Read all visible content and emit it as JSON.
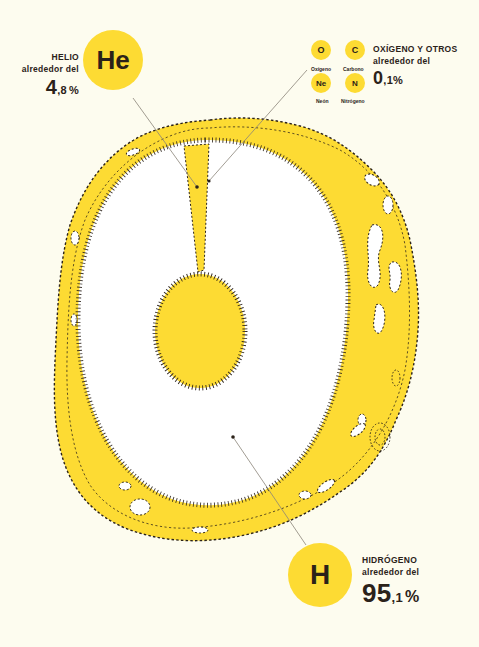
{
  "colors": {
    "background": "#fdfcef",
    "yellow": "#fddb33",
    "white": "#ffffff",
    "ink": "#2b2219",
    "leader_line": "#8a8478"
  },
  "helium": {
    "symbol": "He",
    "name": "HELIO",
    "prefix": "alrededor del",
    "value_int": "4",
    "value_dec": ",8",
    "unit": "%"
  },
  "others": {
    "name": "OXÍGENO Y OTROS",
    "prefix": "alrededor del",
    "value_int": "0",
    "value_dec": ",1",
    "unit": "%",
    "elements": [
      {
        "symbol": "O",
        "name": "Oxígeno"
      },
      {
        "symbol": "C",
        "name": "Carbono"
      },
      {
        "symbol": "Ne",
        "name": "Neón"
      },
      {
        "symbol": "N",
        "name": "Nitrógeno"
      }
    ]
  },
  "hydrogen": {
    "symbol": "H",
    "name": "HIDRÓGENO",
    "prefix": "alrededor del",
    "value_int": "95",
    "value_dec": ",1",
    "unit": "%"
  }
}
